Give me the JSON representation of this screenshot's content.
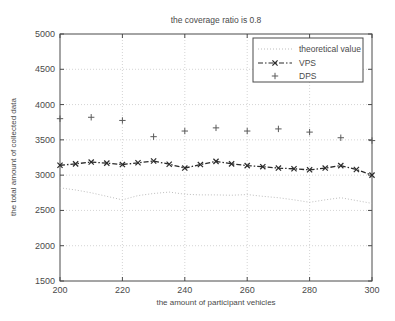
{
  "chart_data": {
    "type": "line",
    "title": "the coverage ratio is 0.8",
    "xlabel": "the amount of participant vehicles",
    "ylabel": "the total amount of collected data",
    "xlim": [
      200,
      300
    ],
    "ylim": [
      1500,
      5000
    ],
    "xticks": [
      200,
      220,
      240,
      260,
      280,
      300
    ],
    "yticks": [
      1500,
      2000,
      2500,
      3000,
      3500,
      4000,
      4500,
      5000
    ],
    "xtick_labels": [
      "200",
      "220",
      "240",
      "260",
      "280",
      "300"
    ],
    "ytick_labels": [
      "1500",
      "2000",
      "2500",
      "3000",
      "3500",
      "4000",
      "4500",
      "5000"
    ],
    "grid": true,
    "grid_style": "dotted",
    "legend_position": "top-right",
    "x": [
      200,
      205,
      210,
      215,
      220,
      225,
      230,
      235,
      240,
      245,
      250,
      255,
      260,
      265,
      270,
      275,
      280,
      285,
      290,
      295,
      300
    ],
    "series": [
      {
        "name": "theoretical value",
        "label": "theoretical value",
        "marker": "none",
        "linestyle": "dotted",
        "color": "#b5b5b5",
        "values": [
          2820,
          2790,
          2750,
          2700,
          2650,
          2710,
          2740,
          2760,
          2730,
          2720,
          2720,
          2715,
          2725,
          2700,
          2680,
          2650,
          2615,
          2650,
          2680,
          2640,
          2600
        ]
      },
      {
        "name": "VPS",
        "label": "VPS",
        "marker": "x",
        "linestyle": "dashdot",
        "color": "#2b2b2b",
        "values": [
          3140,
          3160,
          3185,
          3170,
          3150,
          3175,
          3200,
          3155,
          3100,
          3150,
          3195,
          3160,
          3135,
          3120,
          3100,
          3090,
          3075,
          3100,
          3135,
          3080,
          3000
        ]
      },
      {
        "name": "DPS",
        "label": "DPS",
        "marker": "plus",
        "linestyle": "none",
        "color": "#5a5a5a",
        "values": [
          3800,
          null,
          3820,
          null,
          3775,
          null,
          3545,
          null,
          3625,
          null,
          3670,
          null,
          3625,
          null,
          3655,
          null,
          3610,
          null,
          3530,
          null,
          3490
        ]
      }
    ]
  },
  "legend": {
    "entries": [
      {
        "label": "theoretical value",
        "marker": "dotted-line"
      },
      {
        "label": "VPS",
        "marker": "dashdot-x"
      },
      {
        "label": "DPS",
        "marker": "plus"
      }
    ]
  }
}
